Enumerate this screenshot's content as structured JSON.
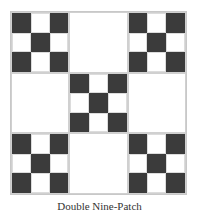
{
  "figure": {
    "caption": "Double Nine-Patch",
    "colors": {
      "dark": "#3b3b3b",
      "light": "#ffffff",
      "grid_line": "#d0d0d0"
    },
    "grid": {
      "blocks_per_side": 3,
      "cells_per_block_side": 3,
      "blocks": [
        [
          "nine-patch",
          "plain",
          "nine-patch"
        ],
        [
          "plain",
          "nine-patch",
          "plain"
        ],
        [
          "nine-patch",
          "plain",
          "nine-patch"
        ]
      ],
      "nine_patch_dark_cells": [
        [
          0,
          0
        ],
        [
          0,
          2
        ],
        [
          1,
          1
        ],
        [
          2,
          0
        ],
        [
          2,
          2
        ]
      ]
    }
  }
}
